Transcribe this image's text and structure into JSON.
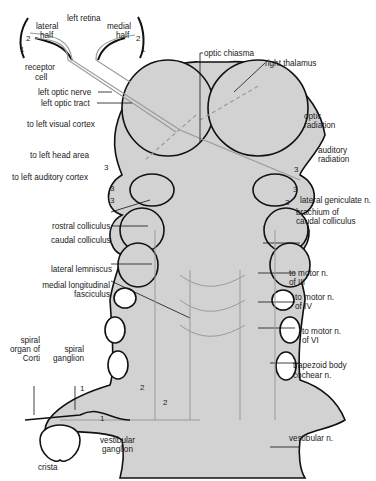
{
  "diagram": {
    "colors": {
      "brainstem_fill": "#d2d2d2",
      "outline": "#111111",
      "pathway": "#9a9a9a",
      "background": "#ffffff"
    },
    "labels": {
      "left_retina": "left retina",
      "lateral_half": [
        "lateral",
        "half"
      ],
      "medial_half": [
        "medial",
        "half"
      ],
      "receptor_cell": [
        "receptor",
        "cell"
      ],
      "left_optic_nerve": "left optic nerve",
      "left_optic_tract": "left optic tract",
      "optic_chiasma": "optic chiasma",
      "right_thalamus": "right thalamus",
      "optic_radiation": [
        "optic",
        "radiation"
      ],
      "auditory_radiation": [
        "auditory",
        "radiation"
      ],
      "lateral_geniculate": "lateral geniculate n.",
      "brachium": [
        "brachium of",
        "caudal colliculus"
      ],
      "to_left_visual_cortex": "to left visual cortex",
      "to_left_head_area": "to left head area",
      "to_left_auditory_cortex": "to left auditory cortex",
      "rostral_colliculus": "rostral colliculus",
      "caudal_colliculus": "caudal colliculus",
      "lateral_lemniscus": "lateral lemniscus",
      "mlf": [
        "medial longitudinal",
        "fasciculus"
      ],
      "motor_iii": [
        "to motor n.",
        "of III"
      ],
      "motor_iv": [
        "to motor n.",
        "of IV"
      ],
      "motor_vi": [
        "to motor n.",
        "of VI"
      ],
      "spiral_organ": [
        "spiral",
        "organ of",
        "Corti"
      ],
      "spiral_ganglion": [
        "spiral",
        "ganglion"
      ],
      "trapezoid_body": "trapezoid body",
      "cochlear_n": "cochear n.",
      "vestibular_ganglion": [
        "vestibular",
        "ganglion"
      ],
      "crista": "crista",
      "vestibular_n": "vestibular n."
    },
    "neuron_numbers": {
      "one": "1",
      "two": "2",
      "three": "3"
    }
  }
}
